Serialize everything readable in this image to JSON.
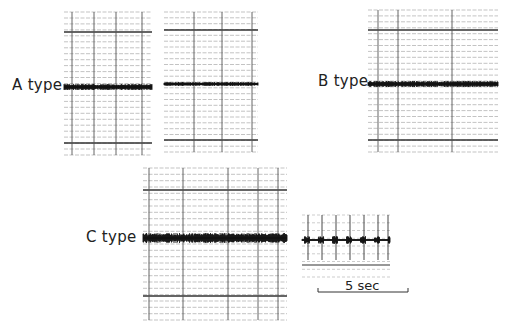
{
  "figure": {
    "labels": {
      "a_type": "A type",
      "b_type": "B type",
      "c_type": "C type",
      "scale": "5 sec"
    },
    "colors": {
      "trace": "#111111",
      "grid_major": "#555555",
      "grid_minor": "#9a9a9a",
      "background": "#ffffff"
    },
    "panels": [
      {
        "id": "a1",
        "x": 64,
        "y": 12,
        "w": 88,
        "h": 143,
        "baseline": 75,
        "vlines": [
          8,
          30,
          52,
          78
        ],
        "thick_h": [
          20,
          131
        ],
        "onset": 24,
        "peak_up": 62,
        "peak_down": 72,
        "decay": 0.1,
        "noise": 3,
        "bursts": [
          {
            "at": 46,
            "amp": 12,
            "w": 6
          }
        ],
        "seed": 3
      },
      {
        "id": "a2",
        "x": 164,
        "y": 12,
        "w": 94,
        "h": 140,
        "baseline": 72,
        "vlines": [
          30,
          58,
          88
        ],
        "thick_h": [
          18,
          128
        ],
        "onset": 20,
        "peak_up": 48,
        "peak_down": 60,
        "decay": 0.13,
        "noise": 2,
        "bursts": [
          {
            "at": 52,
            "amp": 12,
            "w": 5
          },
          {
            "at": 80,
            "amp": 5,
            "w": 4
          }
        ],
        "seed": 7
      },
      {
        "id": "b",
        "x": 368,
        "y": 10,
        "w": 130,
        "h": 142,
        "baseline": 74,
        "vlines": [
          10,
          30,
          84
        ],
        "thick_h": [
          20,
          130
        ],
        "onset": 14,
        "peak_up": 52,
        "peak_down": 58,
        "decay": 0.03,
        "noise": 3,
        "sustain": 14,
        "bursts": [],
        "seed": 11
      },
      {
        "id": "c",
        "x": 143,
        "y": 168,
        "w": 144,
        "h": 152,
        "baseline": 70,
        "vlines": [
          6,
          40,
          85,
          115,
          135
        ],
        "thick_h": [
          22,
          128
        ],
        "onset": 20,
        "peak_up": 62,
        "peak_down": 70,
        "decay": 0.02,
        "noise": 5,
        "ramp": 35,
        "sustain": 20,
        "bursts": [],
        "seed": 19
      }
    ],
    "time_marks": {
      "x": 302,
      "y": 215,
      "w": 88,
      "h": 62,
      "baseline": 25,
      "marks": [
        6,
        20,
        34,
        48,
        62,
        76,
        86
      ],
      "thick_h": [
        50
      ]
    },
    "scale_bar": {
      "x1": 318,
      "x2": 408,
      "y": 292,
      "tick": 4
    },
    "chart_data": {
      "type": "waveform",
      "title": "",
      "series": [
        {
          "name": "A type (1)",
          "description": "impulsive onset, rapid decay, short duration"
        },
        {
          "name": "A type (2)",
          "description": "impulsive onset, rapid decay with small later phase"
        },
        {
          "name": "B type",
          "description": "emergent high-amplitude onset with long coda"
        },
        {
          "name": "C type",
          "description": "gradual build-up, long irregular high-amplitude signal"
        },
        {
          "name": "Time marks",
          "description": "1-second time marks"
        }
      ],
      "scale": "5 sec"
    }
  }
}
